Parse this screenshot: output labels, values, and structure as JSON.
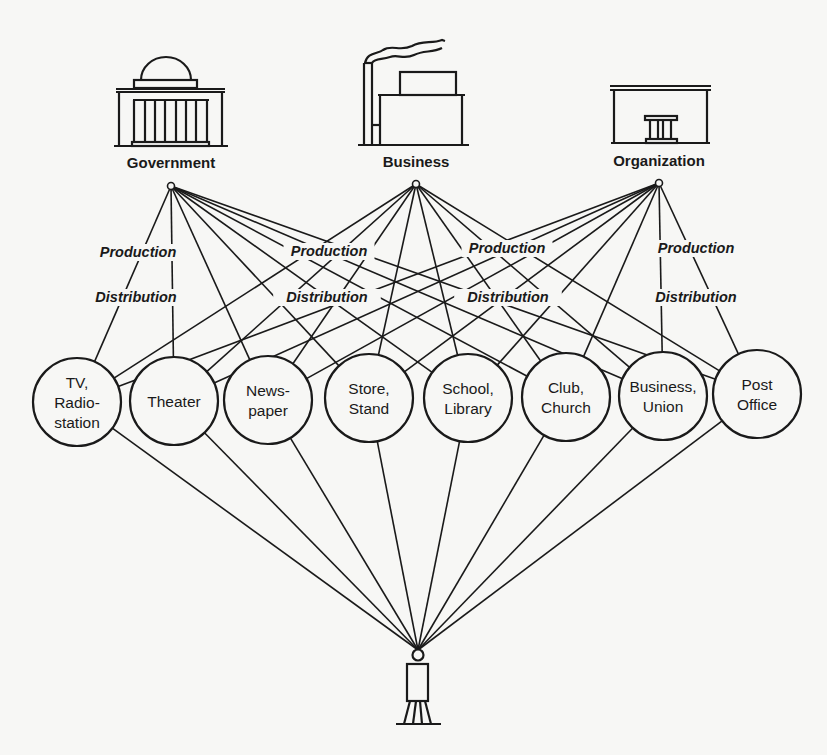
{
  "sources": [
    {
      "id": "government",
      "label": "Government",
      "icon": "government-building-icon",
      "hub": [
        171,
        186
      ]
    },
    {
      "id": "business",
      "label": "Business",
      "icon": "factory-icon",
      "hub": [
        416,
        184
      ]
    },
    {
      "id": "organization",
      "label": "Organization",
      "icon": "organization-building-icon",
      "hub": [
        659,
        183
      ]
    }
  ],
  "flow_labels": [
    {
      "text": "Production",
      "x": 138,
      "y": 257
    },
    {
      "text": "Distribution",
      "x": 136,
      "y": 302
    },
    {
      "text": "Production",
      "x": 329,
      "y": 256
    },
    {
      "text": "Distribution",
      "x": 327,
      "y": 302
    },
    {
      "text": "Production",
      "x": 507,
      "y": 253
    },
    {
      "text": "Distribution",
      "x": 508,
      "y": 302
    },
    {
      "text": "Production",
      "x": 696,
      "y": 253
    },
    {
      "text": "Distribution",
      "x": 696,
      "y": 302
    }
  ],
  "channels": [
    {
      "lines": [
        "TV,",
        "Radio-",
        "station"
      ],
      "cx": 77,
      "cy": 402
    },
    {
      "lines": [
        "Theater"
      ],
      "cx": 174,
      "cy": 401
    },
    {
      "lines": [
        "News-",
        "paper"
      ],
      "cx": 268,
      "cy": 400
    },
    {
      "lines": [
        "Store,",
        "Stand"
      ],
      "cx": 369,
      "cy": 398
    },
    {
      "lines": [
        "School,",
        "Library"
      ],
      "cx": 468,
      "cy": 398
    },
    {
      "lines": [
        "Club,",
        "Church"
      ],
      "cx": 566,
      "cy": 397
    },
    {
      "lines": [
        "Business,",
        "Union"
      ],
      "cx": 663,
      "cy": 396
    },
    {
      "lines": [
        "Post",
        "Office"
      ],
      "cx": 757,
      "cy": 394
    }
  ],
  "channel_radius": 44,
  "receiver": {
    "label": "",
    "icon": "person-icon",
    "head": [
      418,
      655
    ]
  }
}
